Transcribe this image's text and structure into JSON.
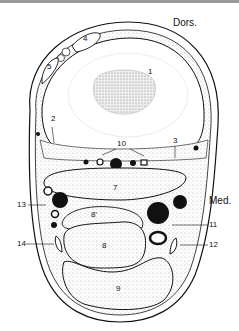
{
  "figure": {
    "type": "anatomical cross-section diagram",
    "orientation_labels": {
      "dorsal": "Dors.",
      "medial": "Med."
    },
    "labels": [
      {
        "id": "1",
        "text": "1"
      },
      {
        "id": "2",
        "text": "2"
      },
      {
        "id": "3",
        "text": "3"
      },
      {
        "id": "4",
        "text": "4"
      },
      {
        "id": "5",
        "text": "5"
      },
      {
        "id": "7",
        "text": "7"
      },
      {
        "id": "8p",
        "text": "8'"
      },
      {
        "id": "8",
        "text": "8"
      },
      {
        "id": "9",
        "text": "9"
      },
      {
        "id": "10",
        "text": "10"
      },
      {
        "id": "11",
        "text": "11"
      },
      {
        "id": "12",
        "text": "12"
      },
      {
        "id": "13",
        "text": "13"
      },
      {
        "id": "14",
        "text": "14"
      }
    ],
    "colors": {
      "ink": "#111111",
      "stipple": "#d8d8d8",
      "background": "#ffffff"
    }
  }
}
